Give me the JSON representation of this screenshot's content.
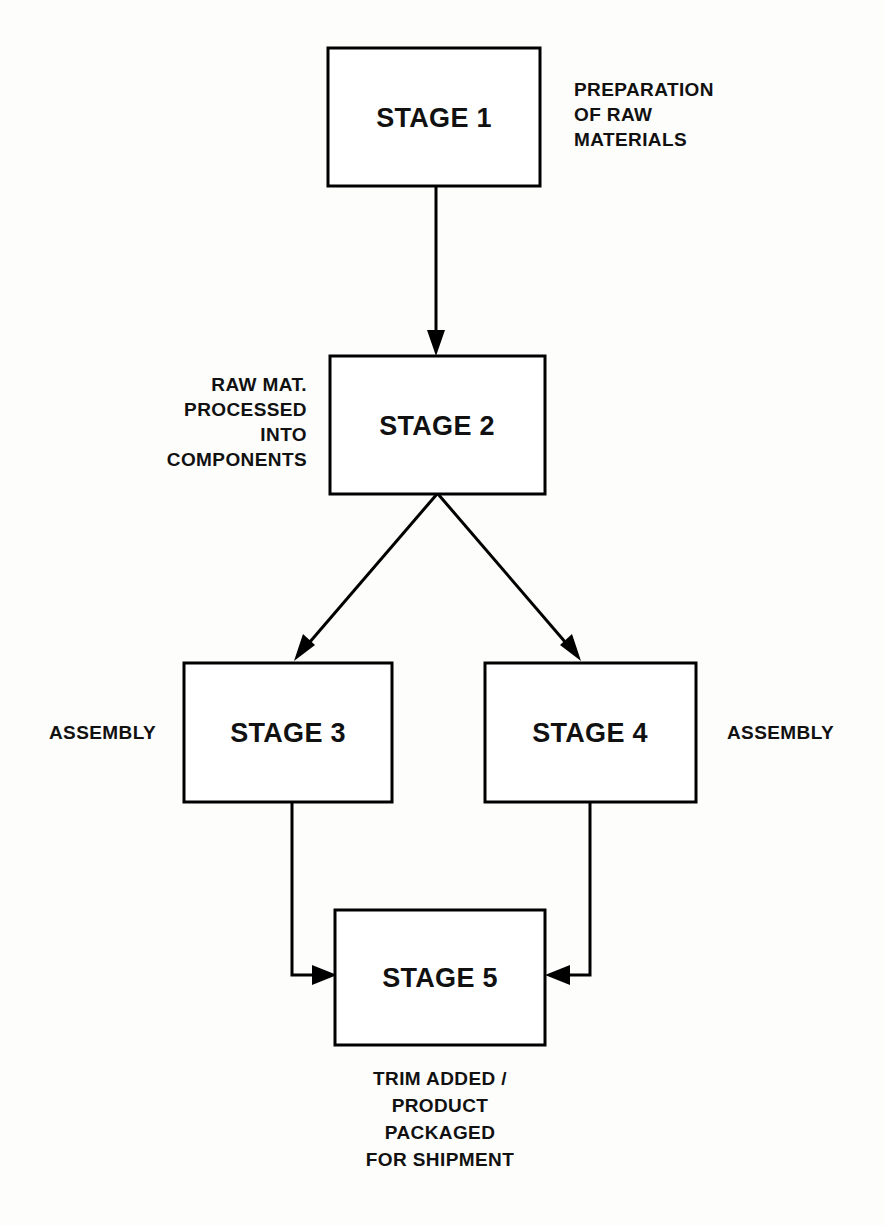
{
  "diagram": {
    "background_color": "#fdfdfc",
    "line_color": "#000000",
    "text_color": "#111111",
    "nodes": [
      {
        "id": "stage1",
        "label": "STAGE 1"
      },
      {
        "id": "stage2",
        "label": "STAGE 2"
      },
      {
        "id": "stage3",
        "label": "STAGE 3"
      },
      {
        "id": "stage4",
        "label": "STAGE 4"
      },
      {
        "id": "stage5",
        "label": "STAGE 5"
      }
    ],
    "annotations": {
      "stage1_caption": {
        "align": "left",
        "lines": [
          "PREPARATION",
          "OF RAW",
          "MATERIALS"
        ]
      },
      "stage2_caption": {
        "align": "right",
        "lines": [
          "RAW MAT.",
          "PROCESSED",
          "INTO",
          "COMPONENTS"
        ]
      },
      "stage3_caption": {
        "align": "right",
        "lines": [
          "ASSEMBLY"
        ]
      },
      "stage4_caption": {
        "align": "left",
        "lines": [
          "ASSEMBLY"
        ]
      },
      "stage5_caption": {
        "align": "center",
        "lines": [
          "TRIM ADDED /",
          "PRODUCT",
          "PACKAGED",
          "FOR SHIPMENT"
        ]
      }
    },
    "edges": [
      {
        "id": "e1",
        "from": "stage1",
        "to": "stage2",
        "shape": "vertical"
      },
      {
        "id": "e2",
        "from": "stage2",
        "to": "stage3",
        "shape": "diagonal-left"
      },
      {
        "id": "e3",
        "from": "stage2",
        "to": "stage4",
        "shape": "diagonal-right"
      },
      {
        "id": "e4",
        "from": "stage3",
        "to": "stage5",
        "shape": "elbow-left"
      },
      {
        "id": "e5",
        "from": "stage4",
        "to": "stage5",
        "shape": "elbow-right"
      }
    ]
  }
}
